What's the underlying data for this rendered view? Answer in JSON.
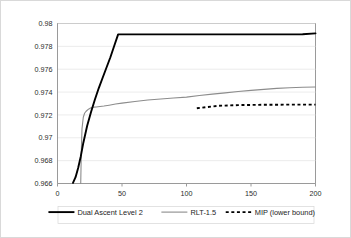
{
  "chart_data": {
    "type": "line",
    "title": "",
    "xlabel": "",
    "ylabel": "",
    "xlim": [
      0,
      200
    ],
    "ylim": [
      0.966,
      0.98
    ],
    "grid": true,
    "legend_position": "bottom",
    "xticks": [
      "0",
      "50",
      "100",
      "150",
      "200"
    ],
    "xtick_values": [
      0,
      50,
      100,
      150,
      200
    ],
    "yticks": [
      "0.966",
      "0.968",
      "0.97",
      "0.972",
      "0.974",
      "0.976",
      "0.978",
      "0.98"
    ],
    "ytick_values": [
      0.966,
      0.968,
      0.97,
      0.972,
      0.974,
      0.976,
      0.978,
      0.98
    ],
    "series": [
      {
        "name": "Dual Ascent Level 2",
        "style": "solid",
        "color": "#000000",
        "x": [
          12,
          14,
          16,
          18,
          20,
          23,
          26,
          29,
          32,
          35,
          38,
          41,
          44,
          47,
          50,
          55,
          60,
          65,
          70,
          75,
          80,
          85,
          90,
          95,
          100,
          105,
          110,
          115,
          120,
          125,
          130,
          140,
          150,
          160,
          170,
          180,
          190,
          200
        ],
        "y": [
          0.96605,
          0.96655,
          0.96735,
          0.96835,
          0.96955,
          0.97105,
          0.97225,
          0.97335,
          0.97435,
          0.97525,
          0.97615,
          0.97705,
          0.97805,
          0.97905,
          0.97435,
          0.97475,
          0.9751,
          0.97542,
          0.97572,
          0.976,
          0.97626,
          0.9765,
          0.97672,
          0.97693,
          0.9774,
          0.97756,
          0.97768,
          0.97778,
          0.97788,
          0.978,
          0.97812,
          0.97832,
          0.9785,
          0.97868,
          0.97883,
          0.97896,
          0.97906,
          0.97914
        ]
      },
      {
        "name": "RLT-1.5",
        "style": "solid",
        "color": "#8c8c8c",
        "x": [
          18,
          18.5,
          19,
          20,
          21,
          22,
          24,
          26,
          28,
          30,
          33,
          36,
          40,
          45,
          50,
          60,
          70,
          80,
          90,
          100,
          110,
          120,
          130,
          140,
          150,
          160,
          170,
          180,
          190,
          200
        ],
        "y": [
          0.966,
          0.969,
          0.9708,
          0.9718,
          0.97215,
          0.9723,
          0.9725,
          0.97262,
          0.97268,
          0.9727,
          0.97274,
          0.97278,
          0.97285,
          0.97295,
          0.97303,
          0.97318,
          0.9733,
          0.9734,
          0.97348,
          0.97356,
          0.9737,
          0.97382,
          0.97393,
          0.97405,
          0.97415,
          0.97424,
          0.97432,
          0.97438,
          0.97442,
          0.97445
        ]
      },
      {
        "name": "MIP (lower bound)",
        "style": "dashed",
        "color": "#000000",
        "x": [
          108,
          115,
          125,
          140,
          160,
          180,
          200
        ],
        "y": [
          0.97258,
          0.97268,
          0.9728,
          0.97286,
          0.97289,
          0.9729,
          0.9729
        ]
      }
    ],
    "legend": [
      {
        "label": "Dual Ascent Level 2",
        "style": "solid",
        "color": "#000000"
      },
      {
        "label": "RLT-1.5",
        "style": "solid",
        "color": "#8c8c8c"
      },
      {
        "label": "MIP (lower bound)",
        "style": "dashed",
        "color": "#000000"
      }
    ]
  }
}
